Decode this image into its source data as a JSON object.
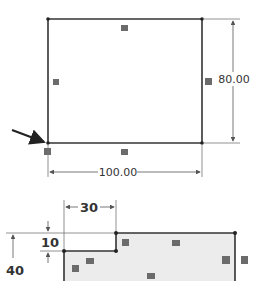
{
  "sketch1": {
    "rect": {
      "x1": 48,
      "y1": 19,
      "x2": 202,
      "y2": 143
    },
    "width_dim": {
      "label": "100.00",
      "y": 172
    },
    "height_dim": {
      "label": "80.00",
      "x": 232
    },
    "pointer_arrow": {
      "from": [
        12,
        130
      ],
      "to": [
        45,
        142
      ]
    }
  },
  "sketch2": {
    "dim_30": {
      "label": "30"
    },
    "dim_10": {
      "label": "10"
    },
    "dim_40": {
      "label": "40"
    }
  },
  "colors": {
    "sketch_line": "#333333",
    "dim_line": "#555555",
    "relation_badge": "#6b6b6b",
    "fill_region": "#ececec"
  }
}
